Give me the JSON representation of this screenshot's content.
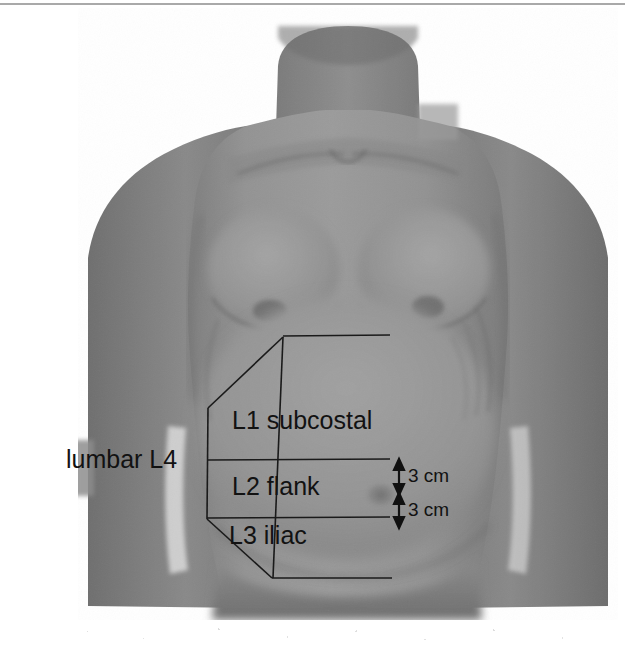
{
  "figure": {
    "background_color": "#ffffff",
    "skin_tone": "#8f8f8f",
    "line_color": "#1a1a1a",
    "text_color": "#121212"
  },
  "labels": {
    "lumbar": "lumbar L4",
    "zone_1": "L1 subcostal",
    "zone_2": "L2 flank",
    "zone_3": "L3 iliac"
  },
  "measurements": {
    "upper": "3 cm",
    "lower": "3 cm"
  },
  "zones": [
    {
      "id": "L1",
      "name": "subcostal",
      "label": "L1 subcostal"
    },
    {
      "id": "L2",
      "name": "flank",
      "label": "L2 flank"
    },
    {
      "id": "L3",
      "name": "iliac",
      "label": "L3 iliac"
    },
    {
      "id": "L4",
      "name": "lumbar",
      "label": "lumbar L4"
    }
  ],
  "annotations": {
    "arrow_upper_label": "3 cm",
    "arrow_lower_label": "3 cm"
  }
}
